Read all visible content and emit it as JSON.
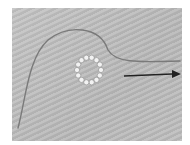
{
  "image": {
    "description": "Photograph of a thin wire with a loop of small clear beads, and an arrow pointing right indicating pull direction",
    "background_color": "#bfbfbf",
    "wire_color": "#7a7a7a",
    "bead_color": "#f2f2f2",
    "arrow_color": "#222222",
    "bead_count": 14
  }
}
